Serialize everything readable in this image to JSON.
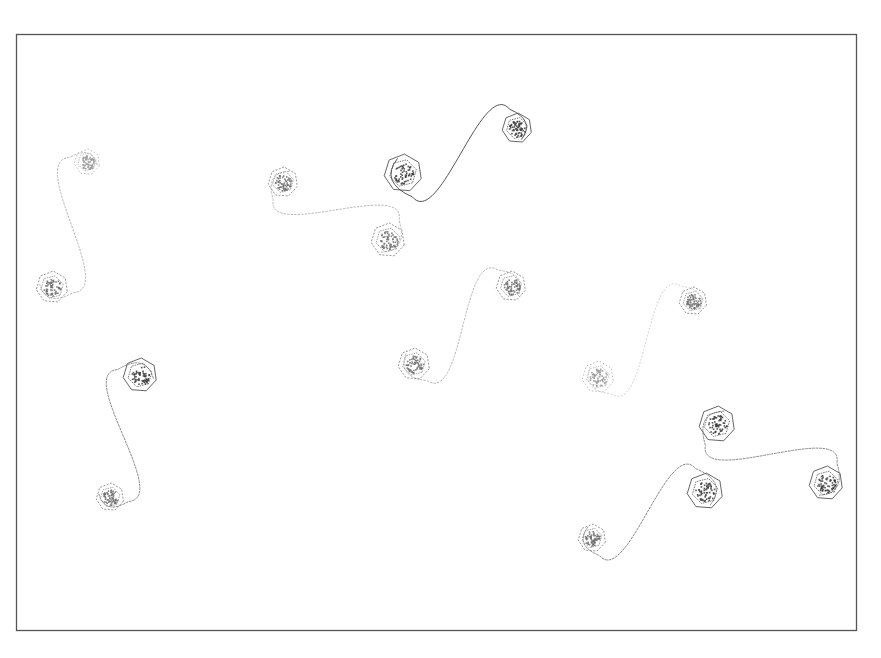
{
  "figure": {
    "frame": {
      "x": 16,
      "y": 34,
      "width": 841,
      "height": 597,
      "stroke": "#555555"
    },
    "colors": {
      "dark": "#555555",
      "mid": "#8a8a8a",
      "light": "#b4b4b4",
      "faint": "#cfcfcf"
    },
    "vortex_pairs": [
      {
        "id": "pair-1",
        "a": {
          "x": 87,
          "y": 162,
          "r": 13,
          "shade": "light"
        },
        "b": {
          "x": 52,
          "y": 287,
          "r": 16,
          "shade": "mid"
        },
        "tone": "light"
      },
      {
        "id": "pair-2",
        "a": {
          "x": 140,
          "y": 375,
          "r": 17,
          "shade": "dark"
        },
        "b": {
          "x": 110,
          "y": 497,
          "r": 14,
          "shade": "mid"
        },
        "tone": "mid"
      },
      {
        "id": "pair-3",
        "a": {
          "x": 283,
          "y": 182,
          "r": 15,
          "shade": "mid"
        },
        "b": {
          "x": 388,
          "y": 240,
          "r": 17,
          "shade": "mid"
        },
        "tone": "light"
      },
      {
        "id": "pair-4",
        "a": {
          "x": 403,
          "y": 173,
          "r": 19,
          "shade": "dark"
        },
        "b": {
          "x": 517,
          "y": 128,
          "r": 15,
          "shade": "dark"
        },
        "tone": "dark"
      },
      {
        "id": "pair-5",
        "a": {
          "x": 414,
          "y": 364,
          "r": 16,
          "shade": "mid"
        },
        "b": {
          "x": 511,
          "y": 286,
          "r": 15,
          "shade": "mid"
        },
        "tone": "light"
      },
      {
        "id": "pair-6",
        "a": {
          "x": 598,
          "y": 377,
          "r": 16,
          "shade": "light"
        },
        "b": {
          "x": 693,
          "y": 301,
          "r": 14,
          "shade": "mid"
        },
        "tone": "faint"
      },
      {
        "id": "pair-7",
        "a": {
          "x": 717,
          "y": 424,
          "r": 18,
          "shade": "dark"
        },
        "b": {
          "x": 826,
          "y": 483,
          "r": 17,
          "shade": "dark"
        },
        "tone": "mid"
      },
      {
        "id": "pair-8",
        "a": {
          "x": 705,
          "y": 491,
          "r": 18,
          "shade": "dark"
        },
        "b": {
          "x": 592,
          "y": 538,
          "r": 14,
          "shade": "mid"
        },
        "tone": "mid"
      }
    ]
  }
}
